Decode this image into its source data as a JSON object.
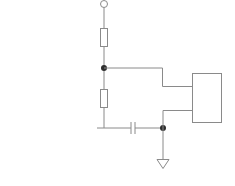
{
  "diagram": {
    "type": "circuit-schematic",
    "colors": {
      "wire": "#8a8a8a",
      "junction": "#2e2e2e",
      "background": "#ffffff"
    },
    "components": [
      {
        "id": "terminal",
        "kind": "open-terminal"
      },
      {
        "id": "R1",
        "kind": "resistor"
      },
      {
        "id": "R2",
        "kind": "resistor"
      },
      {
        "id": "C1",
        "kind": "capacitor"
      },
      {
        "id": "U1",
        "kind": "ic-block"
      },
      {
        "id": "GND",
        "kind": "ground"
      }
    ],
    "junctions": 2
  }
}
